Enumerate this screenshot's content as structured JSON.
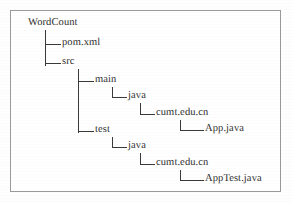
{
  "figure": {
    "kind": "directory-tree-diagram",
    "border_color": "#9a9a9a",
    "background_color": "#ffffff",
    "text_color": "#2e2e2e"
  },
  "tree": {
    "root_label": "WordCount",
    "nodes": [
      {
        "id": "wordcount",
        "label": "WordCount",
        "depth": 0,
        "x": 28,
        "y": 26,
        "connector": "none"
      },
      {
        "id": "pomxml",
        "label": "pom.xml",
        "depth": 1,
        "x": 62,
        "y": 46,
        "connector": "tee"
      },
      {
        "id": "src",
        "label": "src",
        "depth": 1,
        "x": 62,
        "y": 65,
        "connector": "elbow"
      },
      {
        "id": "main",
        "label": "main",
        "depth": 2,
        "x": 95,
        "y": 83,
        "connector": "tee"
      },
      {
        "id": "main-java",
        "label": "java",
        "depth": 3,
        "x": 128,
        "y": 99,
        "connector": "elbow"
      },
      {
        "id": "main-pkg",
        "label": "cumt.edu.cn",
        "depth": 4,
        "x": 156,
        "y": 116,
        "connector": "elbow"
      },
      {
        "id": "app-java",
        "label": "App.java",
        "depth": 5,
        "x": 205,
        "y": 132,
        "connector": "elbow"
      },
      {
        "id": "test",
        "label": "test",
        "depth": 2,
        "x": 95,
        "y": 133,
        "connector": "elbow"
      },
      {
        "id": "test-java",
        "label": "java",
        "depth": 3,
        "x": 128,
        "y": 149,
        "connector": "elbow"
      },
      {
        "id": "test-pkg",
        "label": "cumt.edu.cn",
        "depth": 4,
        "x": 156,
        "y": 166,
        "connector": "elbow"
      },
      {
        "id": "apptest",
        "label": "AppTest.java",
        "depth": 5,
        "x": 205,
        "y": 182,
        "connector": "elbow"
      }
    ],
    "connectors": [
      {
        "id": "stem-root",
        "from": "wordcount",
        "type": "vertical",
        "x": 45,
        "y1": 30,
        "y2": 65
      },
      {
        "id": "branch-pomxml",
        "from": "wordcount",
        "type": "horizontal",
        "y": 44,
        "x1": 45,
        "x2": 60
      },
      {
        "id": "branch-src",
        "from": "wordcount",
        "type": "horizontal",
        "y": 63,
        "x1": 45,
        "x2": 60
      },
      {
        "id": "stem-src",
        "from": "src",
        "type": "vertical",
        "x": 78,
        "y1": 69,
        "y2": 132
      },
      {
        "id": "branch-main",
        "from": "src",
        "type": "horizontal",
        "y": 81,
        "x1": 78,
        "x2": 93
      },
      {
        "id": "branch-test",
        "from": "src",
        "type": "horizontal",
        "y": 131,
        "x1": 78,
        "x2": 93
      },
      {
        "id": "stem-main",
        "from": "main",
        "type": "vertical",
        "x": 112,
        "y1": 87,
        "y2": 97
      },
      {
        "id": "branch-mainjava",
        "from": "main",
        "type": "horizontal",
        "y": 97,
        "x1": 112,
        "x2": 126
      },
      {
        "id": "stem-mainjava",
        "from": "main-java",
        "type": "vertical",
        "x": 140,
        "y1": 103,
        "y2": 114
      },
      {
        "id": "branch-mainpkg",
        "from": "main-java",
        "type": "horizontal",
        "y": 114,
        "x1": 140,
        "x2": 154
      },
      {
        "id": "stem-mainpkg",
        "from": "main-pkg",
        "type": "vertical",
        "x": 180,
        "y1": 120,
        "y2": 130
      },
      {
        "id": "branch-app",
        "from": "main-pkg",
        "type": "horizontal",
        "y": 130,
        "x1": 180,
        "x2": 203
      },
      {
        "id": "stem-test",
        "from": "test",
        "type": "vertical",
        "x": 112,
        "y1": 137,
        "y2": 147
      },
      {
        "id": "branch-testjava",
        "from": "test",
        "type": "horizontal",
        "y": 147,
        "x1": 112,
        "x2": 126
      },
      {
        "id": "stem-testjava",
        "from": "test-java",
        "type": "vertical",
        "x": 140,
        "y1": 153,
        "y2": 164
      },
      {
        "id": "branch-testpkg",
        "from": "test-java",
        "type": "horizontal",
        "y": 164,
        "x1": 140,
        "x2": 154
      },
      {
        "id": "stem-testpkg",
        "from": "test-pkg",
        "type": "vertical",
        "x": 180,
        "y1": 170,
        "y2": 180
      },
      {
        "id": "branch-apptest",
        "from": "test-pkg",
        "type": "horizontal",
        "y": 180,
        "x1": 180,
        "x2": 203
      }
    ]
  }
}
